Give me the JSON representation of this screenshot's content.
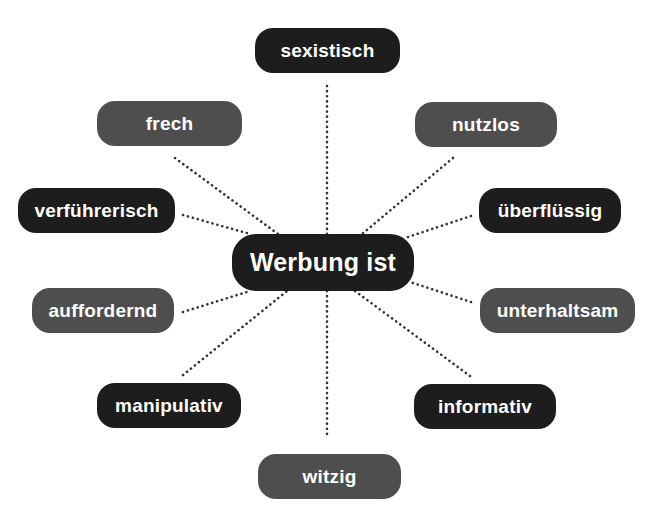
{
  "diagram": {
    "type": "mind-map",
    "center": {
      "label": "Werbung ist",
      "style": "dark"
    },
    "colors": {
      "dark": "#1d1d1d",
      "gray": "#4e4e4e",
      "text": "#ffffff",
      "line": "#333333"
    },
    "nodes": [
      {
        "id": "sexistisch",
        "label": "sexistisch",
        "style": "dark"
      },
      {
        "id": "frech",
        "label": "frech",
        "style": "gray"
      },
      {
        "id": "nutzlos",
        "label": "nutzlos",
        "style": "gray"
      },
      {
        "id": "verfuehrerisch",
        "label": "verführerisch",
        "style": "dark"
      },
      {
        "id": "ueberfluessig",
        "label": "überflüssig",
        "style": "dark"
      },
      {
        "id": "auffordernd",
        "label": "auffordernd",
        "style": "gray"
      },
      {
        "id": "unterhaltsam",
        "label": "unterhaltsam",
        "style": "gray"
      },
      {
        "id": "manipulativ",
        "label": "manipulativ",
        "style": "dark"
      },
      {
        "id": "informativ",
        "label": "informativ",
        "style": "dark"
      },
      {
        "id": "witzig",
        "label": "witzig",
        "style": "gray"
      }
    ]
  }
}
